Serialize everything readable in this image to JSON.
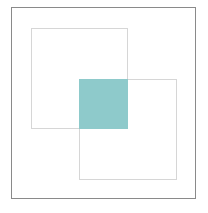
{
  "diagram": {
    "type": "overlapping-squares",
    "frame_color": "#8a8a8a",
    "square_outline_color": "#d6d6d6",
    "overlap_fill_color": "#8ecacb",
    "shapes": [
      {
        "id": "square-1",
        "label": ""
      },
      {
        "id": "square-2",
        "label": ""
      },
      {
        "id": "overlap-region",
        "label": ""
      }
    ]
  }
}
